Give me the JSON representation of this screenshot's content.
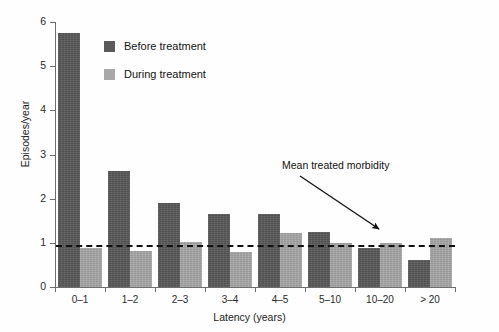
{
  "chart_data": {
    "type": "bar",
    "title": "",
    "subtitle": "",
    "xlabel": "Latency (years)",
    "ylabel": "Episodes/year",
    "categories": [
      "0–1",
      "1–2",
      "2–3",
      "3–4",
      "4–5",
      "5–10",
      "10–20",
      "> 20"
    ],
    "series": [
      {
        "name": "Before treatment",
        "color": "#5a5a5a",
        "values": [
          5.75,
          2.62,
          1.9,
          1.65,
          1.65,
          1.25,
          0.88,
          0.62
        ]
      },
      {
        "name": "During treatment",
        "color": "#a8a8a8",
        "values": [
          0.88,
          0.82,
          1.02,
          0.8,
          1.22,
          1.0,
          1.0,
          1.1
        ]
      }
    ],
    "ylim": [
      0,
      6
    ],
    "yticks": [
      0,
      1,
      2,
      3,
      4,
      5,
      6
    ],
    "ytick_labels": [
      "0",
      "1",
      "2",
      "3",
      "4",
      "5",
      "6"
    ],
    "grid": false,
    "legend_position": "upper-left-inside",
    "reference_line": {
      "value": 0.95,
      "style": "dashed",
      "color": "#111111",
      "label": "Mean treated morbidity"
    },
    "annotations": [
      {
        "text": "Mean treated morbidity",
        "arrow_from": [
          300,
          176
        ],
        "arrow_to": [
          379,
          229
        ]
      }
    ]
  },
  "legend": {
    "items": [
      {
        "label": "Before treatment",
        "color": "#5a5a5a"
      },
      {
        "label": "During treatment",
        "color": "#a8a8a8"
      }
    ]
  },
  "axes": {
    "y_title": "Episodes/year",
    "x_title": "Latency (years)"
  }
}
